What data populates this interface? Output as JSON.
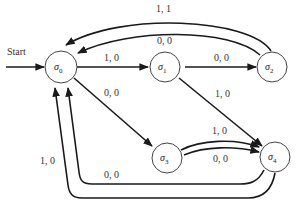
{
  "diagram": {
    "type": "finite-state-machine",
    "start_label": "Start",
    "states": [
      {
        "id": "s0",
        "symbol": "σ",
        "subscript": "0"
      },
      {
        "id": "s1",
        "symbol": "σ",
        "subscript": "1"
      },
      {
        "id": "s2",
        "symbol": "σ",
        "subscript": "2"
      },
      {
        "id": "s3",
        "symbol": "σ",
        "subscript": "3"
      },
      {
        "id": "s4",
        "symbol": "σ",
        "subscript": "4"
      }
    ],
    "transitions": [
      {
        "from": "s0",
        "to": "s1",
        "label": "1, 0"
      },
      {
        "from": "s1",
        "to": "s2",
        "label": "0, 0"
      },
      {
        "from": "s2",
        "to": "s0",
        "label": "1, 1"
      },
      {
        "from": "s2",
        "to": "s0",
        "label": "0, 0"
      },
      {
        "from": "s0",
        "to": "s3",
        "label": "0, 0"
      },
      {
        "from": "s1",
        "to": "s4",
        "label": "1, 0"
      },
      {
        "from": "s3",
        "to": "s4",
        "label": "1, 0"
      },
      {
        "from": "s3",
        "to": "s4",
        "label": "0, 0"
      },
      {
        "from": "s4",
        "to": "s0",
        "label": "0, 0"
      },
      {
        "from": "s4",
        "to": "s0",
        "label": "1, 0"
      }
    ]
  }
}
